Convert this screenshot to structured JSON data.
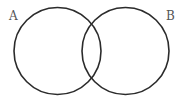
{
  "diagram": {
    "type": "venn",
    "sets": [
      {
        "label": "A",
        "cx": 57.5,
        "cy": 51,
        "r": 43.5
      },
      {
        "label": "B",
        "cx": 125.5,
        "cy": 51,
        "r": 43.5
      }
    ],
    "stroke_color": "#2b2b2b",
    "label_color": "#555555"
  }
}
